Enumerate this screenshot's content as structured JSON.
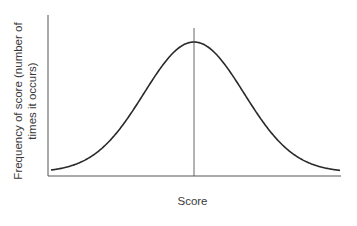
{
  "chart_data": {
    "type": "line",
    "title": "",
    "xlabel": "Score",
    "ylabel": "Frequency of score (number of times it occurs)",
    "series": [
      {
        "name": "normal distribution",
        "x": [
          -3,
          -2.5,
          -2,
          -1.5,
          -1,
          -0.5,
          0,
          0.5,
          1,
          1.5,
          2,
          2.5,
          3
        ],
        "values": [
          0.04,
          0.07,
          0.14,
          0.28,
          0.52,
          0.84,
          1.0,
          0.84,
          0.52,
          0.28,
          0.14,
          0.07,
          0.04
        ]
      }
    ],
    "annotations": [
      {
        "type": "vertical-line",
        "x": 0,
        "label": "mean"
      }
    ],
    "grid": false,
    "legend": "none"
  },
  "labels": {
    "ylabel_line1": "Frequency of score (number of",
    "ylabel_line2": "times it occurs)",
    "xlabel": "Score"
  }
}
